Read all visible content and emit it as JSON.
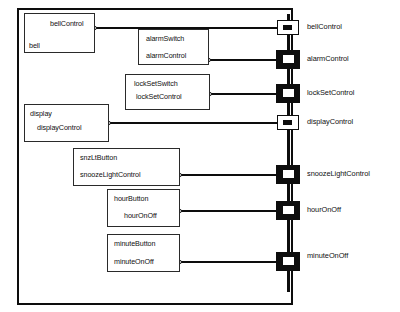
{
  "diagram": {
    "frame_color": "#0d0d0d",
    "bus_color": "#0d0d0d",
    "box_border_color": "#2a2a2a",
    "background_color": "#ffffff"
  },
  "components": [
    {
      "id": "bell",
      "class_label": "bellControl",
      "instance_label": "bell",
      "port_name": "bellControl"
    },
    {
      "id": "alarm",
      "class_label": "alarmSwitch",
      "instance_label": "alarmControl",
      "port_name": "alarmControl"
    },
    {
      "id": "lockset",
      "class_label": "lockSetSwitch",
      "instance_label": "lockSetControl",
      "port_name": "lockSetControl"
    },
    {
      "id": "display",
      "class_label": "display",
      "instance_label": "displayControl",
      "port_name": "displayControl"
    },
    {
      "id": "snooze",
      "class_label": "snzLtButton",
      "instance_label": "snoozeLightControl",
      "port_name": "snoozeLightControl"
    },
    {
      "id": "hour",
      "class_label": "hourButton",
      "instance_label": "hourOnOff",
      "port_name": "hourOnOff"
    },
    {
      "id": "minute",
      "class_label": "minuteButton",
      "instance_label": "minuteOnOff",
      "port_name": "minuteOnOff"
    }
  ],
  "ports": [
    {
      "label": "bellControl",
      "style": "hollow"
    },
    {
      "label": "alarmControl",
      "style": "filled"
    },
    {
      "label": "lockSetControl",
      "style": "filled"
    },
    {
      "label": "displayControl",
      "style": "hollow"
    },
    {
      "label": "snoozeLightControl",
      "style": "filled"
    },
    {
      "label": "hourOnOff",
      "style": "filled"
    },
    {
      "label": "minuteOnOff",
      "style": "filled"
    }
  ]
}
